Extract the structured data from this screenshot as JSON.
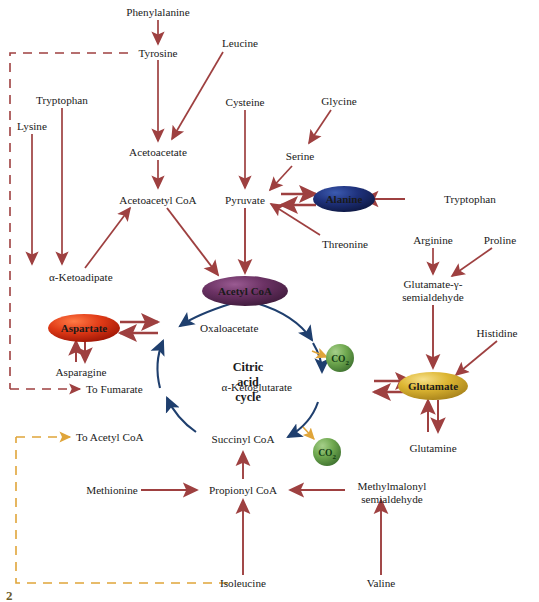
{
  "figure": {
    "page_number": "2",
    "colors": {
      "arrow_red": "#9e4040",
      "arrow_blue": "#1f3f6e",
      "arrow_orange": "#e0a53a",
      "acetyl_coa_pill": "#5c2a57",
      "aspartate_pill": "#d8301a",
      "alanine_pill": "#1b2f73",
      "glutamate_pill": "#d4af2a",
      "co2_bubble": "#6aa84f",
      "text": "#1a1a1a",
      "background": "#ffffff"
    }
  },
  "cycle": {
    "center_label_line1": "Citric",
    "center_label_line2": "acid",
    "center_label_line3": "cycle",
    "intermediates": [
      "Oxaloacetate",
      "α-Ketoglutarate",
      "Succinyl CoA"
    ],
    "byproducts": [
      {
        "formula": "CO",
        "subscript": "2"
      },
      {
        "formula": "CO",
        "subscript": "2"
      }
    ]
  },
  "pills": [
    {
      "id": "acetyl-coa",
      "label": "Acetyl CoA",
      "color": "#5c2a57"
    },
    {
      "id": "aspartate",
      "label": "Aspartate",
      "color": "#d8301a"
    },
    {
      "id": "alanine",
      "label": "Alanine",
      "color": "#1b2f73"
    },
    {
      "id": "glutamate",
      "label": "Glutamate",
      "color": "#d4af2a"
    }
  ],
  "nodes": {
    "phenylalanine": "Phenylalanine",
    "tyrosine": "Tyrosine",
    "leucine": "Leucine",
    "tryptophan_left": "Tryptophan",
    "lysine": "Lysine",
    "cysteine": "Cysteine",
    "glycine": "Glycine",
    "serine": "Serine",
    "acetoacetate": "Acetoacetate",
    "acetoacetyl_coa": "Acetoacetyl CoA",
    "pyruvate": "Pyruvate",
    "tryptophan_right": "Tryptophan",
    "threonine": "Threonine",
    "ketoadipate": "α-Ketoadipate",
    "oxaloacetate": "Oxaloacetate",
    "asparagine": "Asparagine",
    "to_fumarate": "To Fumarate",
    "to_acetyl_coa": "To Acetyl CoA",
    "ketoglutarate": "α-Ketoglutarate",
    "succinyl_coa": "Succinyl CoA",
    "arginine": "Arginine",
    "proline": "Proline",
    "glutamate_semialdehyde_line1": "Glutamate-γ-",
    "glutamate_semialdehyde_line2": "semialdehyde",
    "histidine": "Histidine",
    "glutamine": "Glutamine",
    "methionine": "Methionine",
    "propionyl_coa": "Propionyl CoA",
    "methylmalonyl_line1": "Methylmalonyl",
    "methylmalonyl_line2": "semialdehyde",
    "isoleucine": "Isoleucine",
    "valine": "Valine"
  }
}
